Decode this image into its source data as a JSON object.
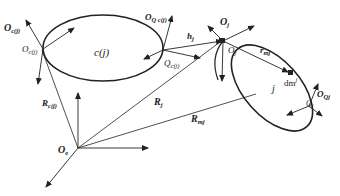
{
  "diagram": {
    "type": "coordinate-frames",
    "bodies": [
      {
        "id": "c(j)",
        "label": "c(j)"
      },
      {
        "id": "j",
        "label": "j"
      }
    ],
    "labels": {
      "O_e": {
        "main": "O",
        "sub": "e"
      },
      "O_cj_bold": {
        "main": "O",
        "sub": "c(j)"
      },
      "O_cj": {
        "main": "O",
        "sub": "c(j)"
      },
      "O_Qcj_bold": {
        "main": "O",
        "sub": "Q c(j)"
      },
      "Q_cj": {
        "main": "Q",
        "sub": "c(j)"
      },
      "h_j": {
        "main": "h",
        "sub": "j"
      },
      "O_j_bold": {
        "main": "O",
        "sub": "j"
      },
      "O_j": {
        "main": "O",
        "sub": "j"
      },
      "r_mj": {
        "main": "r",
        "sub": "mj"
      },
      "dm_j": {
        "main": "dm",
        "sup": "j"
      },
      "O_Qj_bold": {
        "main": "O",
        "sub": "Qj"
      },
      "Q_j": {
        "main": "Q",
        "sub": "j"
      },
      "R_cj": {
        "main": "R",
        "sub": "c(j)"
      },
      "R_j": {
        "main": "R",
        "sub": "j"
      },
      "R_mj": {
        "main": "R",
        "sub": "mj"
      },
      "body_cj": "c(j)",
      "body_j": "j"
    },
    "colors": {
      "line": "#222222",
      "background": "#ffffff"
    }
  }
}
